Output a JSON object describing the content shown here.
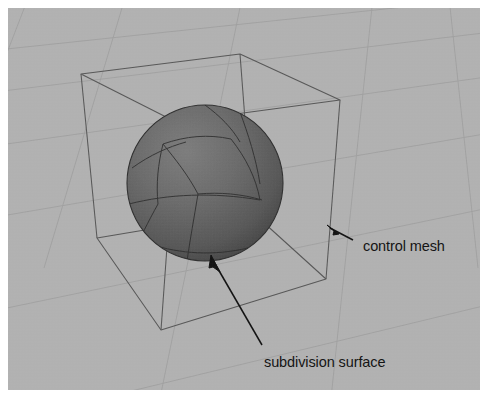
{
  "viewport": {
    "background_color": "#b3b3b3",
    "grid_line_color": "#9b9b9b",
    "wireframe_color": "#4a4a4a",
    "surface_fill_start": "#6e6e6e",
    "surface_fill_end": "#4c4c4c",
    "surface_edge_color": "#2e2e2e"
  },
  "annotations": [
    {
      "id": "control-mesh",
      "label": "control mesh",
      "arrow_tip": {
        "x": 327,
        "y": 227
      },
      "arrow_tail": {
        "x": 353,
        "y": 240
      }
    },
    {
      "id": "subdivision-surface",
      "label": "subdivision surface",
      "arrow_tip": {
        "x": 212,
        "y": 260
      },
      "arrow_tail": {
        "x": 262,
        "y": 345
      }
    }
  ],
  "geometry": {
    "control_mesh": {
      "type": "cube-wireframe",
      "label": "control mesh",
      "vertices": {
        "back_top_left": {
          "x": 81,
          "y": 74
        },
        "back_top_right": {
          "x": 240,
          "y": 54
        },
        "front_top_right": {
          "x": 340,
          "y": 100
        },
        "front_top_left": {
          "x": 176,
          "y": 122
        },
        "back_bottom_left": {
          "x": 97,
          "y": 238
        },
        "back_bottom_right": {
          "x": 252,
          "y": 212
        },
        "front_bottom_right": {
          "x": 326,
          "y": 279
        },
        "front_bottom_left": {
          "x": 161,
          "y": 330
        }
      }
    },
    "subdivision_surface": {
      "type": "sphere",
      "label": "subdivision surface",
      "center": {
        "x": 205,
        "y": 183
      },
      "radius": 78,
      "patch_divisions": 3
    }
  }
}
